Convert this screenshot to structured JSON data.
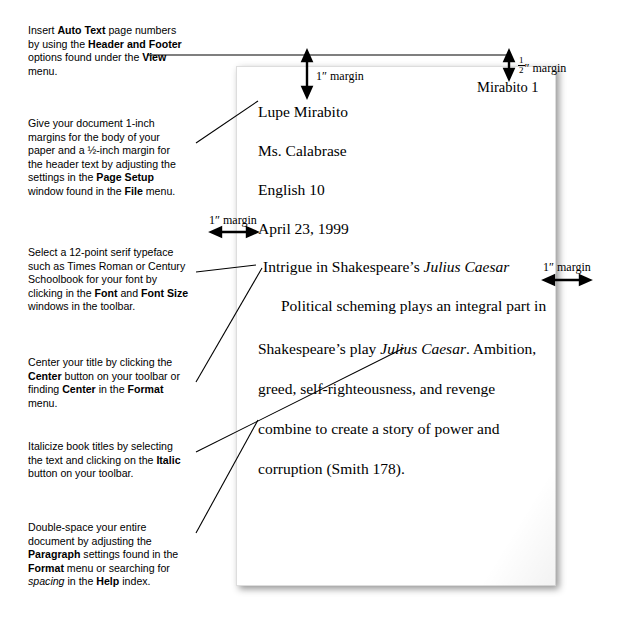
{
  "document": {
    "header_page_number": "Mirabito 1",
    "heading_lines": [
      "Lupe Mirabito",
      "Ms. Calabrase",
      "English 10",
      "April 23, 1999"
    ],
    "title_prefix": "Intrigue in Shakespeare’s ",
    "title_italic": "Julius Caesar",
    "body_lines": [
      {
        "plain": "Political scheming plays an integral part in"
      },
      {
        "pre": "Shakespeare’s play ",
        "italic": "Julius Caesar",
        "post": ". Ambition,"
      },
      {
        "plain": "greed, self-righteousness, and revenge"
      },
      {
        "plain": "combine to create a story of power and"
      },
      {
        "plain": "corruption (Smith 178)."
      }
    ]
  },
  "margin_labels": {
    "top_one_inch": "1″ margin",
    "half_inch": " margin",
    "half_inch_fraction_numerator": "1",
    "half_inch_fraction_denominator": "2",
    "half_inch_prefix": "″",
    "left_one_inch": "1″ margin",
    "right_one_inch": "1″ margin"
  },
  "notes": [
    {
      "id": "auto-text-note",
      "parts": [
        {
          "t": "Insert ",
          "b": false
        },
        {
          "t": "Auto Text",
          "b": true
        },
        {
          "t": " page numbers",
          "b": false
        },
        {
          "t": "\nby using the ",
          "b": false
        },
        {
          "t": "Header and Footer",
          "b": true
        },
        {
          "t": "\noptions found under the ",
          "b": false
        },
        {
          "t": "View",
          "b": true
        },
        {
          "t": "\nmenu.",
          "b": false
        }
      ]
    },
    {
      "id": "margins-note",
      "parts": [
        {
          "t": "Give your document 1-inch",
          "b": false
        },
        {
          "t": "\nmargins for the body of your",
          "b": false
        },
        {
          "t": "\npaper and a ½-inch margin for",
          "b": false
        },
        {
          "t": "\nthe header text by adjusting the",
          "b": false
        },
        {
          "t": "\nsettings in the ",
          "b": false
        },
        {
          "t": "Page Setup",
          "b": true
        },
        {
          "t": "\nwindow found in the ",
          "b": false
        },
        {
          "t": "File",
          "b": true
        },
        {
          "t": " menu.",
          "b": false
        }
      ]
    },
    {
      "id": "typeface-note",
      "parts": [
        {
          "t": "Select a 12-point serif typeface",
          "b": false
        },
        {
          "t": "\nsuch as Times Roman or Century",
          "b": false
        },
        {
          "t": "\nSchoolbook for your font by",
          "b": false
        },
        {
          "t": "\nclicking in the ",
          "b": false
        },
        {
          "t": "Font",
          "b": true
        },
        {
          "t": " and ",
          "b": false
        },
        {
          "t": "Font Size",
          "b": true
        },
        {
          "t": "\nwindows in the toolbar.",
          "b": false
        }
      ]
    },
    {
      "id": "center-title-note",
      "parts": [
        {
          "t": "Center your title by clicking the",
          "b": false
        },
        {
          "t": "\n",
          "b": false
        },
        {
          "t": "Center",
          "b": true
        },
        {
          "t": " button on your toolbar or",
          "b": false
        },
        {
          "t": "\nfinding ",
          "b": false
        },
        {
          "t": "Center",
          "b": true
        },
        {
          "t": " in the ",
          "b": false
        },
        {
          "t": "Format",
          "b": true
        },
        {
          "t": "\nmenu.",
          "b": false
        }
      ]
    },
    {
      "id": "italicize-note",
      "parts": [
        {
          "t": "Italicize book titles by selecting",
          "b": false
        },
        {
          "t": "\nthe text and clicking on the ",
          "b": false
        },
        {
          "t": "Italic",
          "b": true
        },
        {
          "t": "\nbutton on your toolbar.",
          "b": false
        }
      ]
    },
    {
      "id": "double-space-note",
      "parts": [
        {
          "t": "Double-space your entire",
          "b": false
        },
        {
          "t": "\ndocument by adjusting the",
          "b": false
        },
        {
          "t": "\n",
          "b": false
        },
        {
          "t": "Paragraph",
          "b": true
        },
        {
          "t": " settings found in the",
          "b": false
        },
        {
          "t": "\n",
          "b": false
        },
        {
          "t": "Format",
          "b": true
        },
        {
          "t": " menu or searching for",
          "b": false
        },
        {
          "t": "\n",
          "b": false
        },
        {
          "t": "spacing",
          "b": false,
          "i": true
        },
        {
          "t": " in the ",
          "b": false
        },
        {
          "t": "Help",
          "b": true
        },
        {
          "t": " index.",
          "b": false
        }
      ]
    }
  ],
  "colors": {
    "ink": "#000000",
    "paper": "#ffffff",
    "page_background": "#ffffff"
  }
}
